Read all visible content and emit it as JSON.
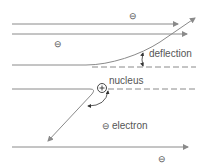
{
  "diagram": {
    "labels": {
      "deflection": "deflection",
      "nucleus": "nucleus",
      "electron": "electron"
    },
    "symbols": {
      "electron": "⊖",
      "nucleus": "⊕"
    },
    "colors": {
      "line": "#8a8a8a",
      "text": "#555555"
    }
  }
}
